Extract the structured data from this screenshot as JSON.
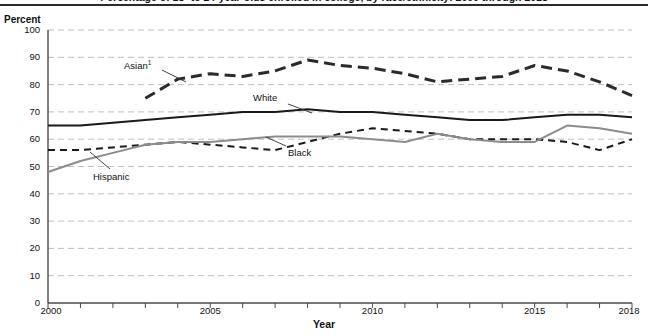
{
  "figure": {
    "title": "Percentage of 18- to 24-year-olds enrolled in college, by race/ethnicity: 2000 through 2018",
    "title_clipped": true
  },
  "axes": {
    "y_axis_title": "Percent",
    "x_axis_title": "Year",
    "y_ticks": [
      0,
      10,
      20,
      30,
      40,
      50,
      60,
      70,
      80,
      90,
      100
    ],
    "y_tick_labels": [
      "0",
      "10",
      "20",
      "30",
      "40",
      "50",
      "60",
      "70",
      "80",
      "90",
      "100"
    ],
    "x_tick_labels": [
      "2000",
      "2005",
      "2010",
      "2015",
      "2018"
    ],
    "x_tick_label_values": [
      2000,
      2005,
      2010,
      2015,
      2018
    ],
    "x_minor_ticks": [
      2000,
      2001,
      2002,
      2003,
      2004,
      2005,
      2006,
      2007,
      2008,
      2009,
      2010,
      2011,
      2012,
      2013,
      2014,
      2015,
      2016,
      2017,
      2018
    ]
  },
  "annotations": [
    {
      "name": "asian-label",
      "text": "Asian",
      "footnote": "1"
    },
    {
      "name": "white-label",
      "text": "White",
      "footnote": ""
    },
    {
      "name": "black-label",
      "text": "Black",
      "footnote": ""
    },
    {
      "name": "hispanic-label",
      "text": "Hispanic",
      "footnote": ""
    }
  ],
  "colors": {
    "asian": "#2b2b2b",
    "white": "#1a1a1a",
    "black": "#1a1a1a",
    "hispanic": "#8c8c8c",
    "gridline": "#bfbfbf",
    "axis": "#4a4a4a",
    "background": "#ffffff"
  },
  "chart_data": {
    "type": "line",
    "title": "Percentage of 18- to 24-year-olds enrolled in college, by race/ethnicity: 2000 through 2018",
    "xlabel": "Year",
    "ylabel": "Percent",
    "xlim": [
      2000,
      2018
    ],
    "ylim": [
      0,
      100
    ],
    "grid": true,
    "legend_position": "inline-labels-with-leader-lines",
    "x": [
      2000,
      2001,
      2002,
      2003,
      2004,
      2005,
      2006,
      2007,
      2008,
      2009,
      2010,
      2011,
      2012,
      2013,
      2014,
      2015,
      2016,
      2017,
      2018
    ],
    "series": [
      {
        "name": "Asian",
        "label": "Asian1",
        "style": "dashed-thick",
        "color": "#2b2b2b",
        "x": [
          2003,
          2004,
          2005,
          2006,
          2007,
          2008,
          2009,
          2010,
          2011,
          2012,
          2013,
          2014,
          2015,
          2016,
          2017,
          2018
        ],
        "values": [
          75,
          82,
          84,
          83,
          85,
          89,
          87,
          86,
          84,
          81,
          82,
          83,
          87,
          85,
          81,
          76
        ]
      },
      {
        "name": "White",
        "label": "White",
        "style": "solid",
        "color": "#1a1a1a",
        "x": [
          2000,
          2001,
          2002,
          2003,
          2004,
          2005,
          2006,
          2007,
          2008,
          2009,
          2010,
          2011,
          2012,
          2013,
          2014,
          2015,
          2016,
          2017,
          2018
        ],
        "values": [
          65,
          65,
          66,
          67,
          68,
          69,
          70,
          70,
          71,
          70,
          70,
          69,
          68,
          67,
          67,
          68,
          69,
          69,
          68
        ]
      },
      {
        "name": "Black",
        "label": "Black",
        "style": "dashed-thin",
        "color": "#1a1a1a",
        "x": [
          2000,
          2001,
          2002,
          2003,
          2004,
          2005,
          2006,
          2007,
          2008,
          2009,
          2010,
          2011,
          2012,
          2013,
          2014,
          2015,
          2016,
          2017,
          2018
        ],
        "values": [
          56,
          56,
          57,
          58,
          59,
          58,
          57,
          56,
          59,
          62,
          64,
          63,
          62,
          60,
          60,
          60,
          59,
          56,
          60
        ]
      },
      {
        "name": "Hispanic",
        "label": "Hispanic",
        "style": "solid-gray",
        "color": "#8c8c8c",
        "x": [
          2000,
          2001,
          2002,
          2003,
          2004,
          2005,
          2006,
          2007,
          2008,
          2009,
          2010,
          2011,
          2012,
          2013,
          2014,
          2015,
          2016,
          2017,
          2018
        ],
        "values": [
          48,
          52,
          55,
          58,
          59,
          59,
          60,
          61,
          61,
          61,
          60,
          59,
          62,
          60,
          59,
          59,
          65,
          64,
          62
        ]
      }
    ]
  }
}
